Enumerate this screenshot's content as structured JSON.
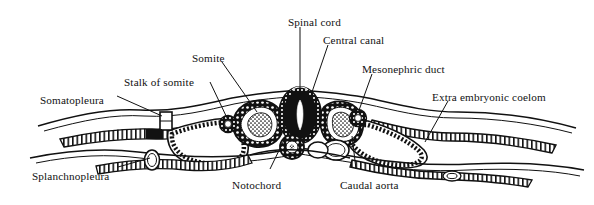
{
  "figure": {
    "background_color": "#ffffff",
    "ink_color": "#111111",
    "labels": [
      {
        "id": "spinal-cord",
        "text": "Spinal cord",
        "x": 288,
        "y": 16,
        "anchor": "start"
      },
      {
        "id": "central-canal",
        "text": "Central canal",
        "x": 323,
        "y": 34,
        "anchor": "start"
      },
      {
        "id": "somite",
        "text": "Somite",
        "x": 192,
        "y": 52,
        "anchor": "start"
      },
      {
        "id": "mesonephric-duct",
        "text": "Mesonephric duct",
        "x": 362,
        "y": 63,
        "anchor": "start"
      },
      {
        "id": "stalk-of-somite",
        "text": "Stalk of somite",
        "x": 124,
        "y": 76,
        "anchor": "start"
      },
      {
        "id": "extra-embryonic-coelom",
        "text": "Extra embryonic coelom",
        "x": 432,
        "y": 91,
        "anchor": "start"
      },
      {
        "id": "somatopleura",
        "text": "Somatopleura",
        "x": 40,
        "y": 94,
        "anchor": "start"
      },
      {
        "id": "splanchnopleura",
        "text": "Splanchnopleura",
        "x": 32,
        "y": 170,
        "anchor": "start"
      },
      {
        "id": "notochord",
        "text": "Notochord",
        "x": 232,
        "y": 179,
        "anchor": "start"
      },
      {
        "id": "caudal-aorta",
        "text": "Caudal aorta",
        "x": 340,
        "y": 179,
        "anchor": "start"
      }
    ],
    "leader_lines": [
      {
        "id": "leader-spinal-cord",
        "points": "300,27 300,95"
      },
      {
        "id": "leader-central-canal",
        "points": "328,45 312,92"
      },
      {
        "id": "leader-somite",
        "points": "222,62 257,112"
      },
      {
        "id": "leader-mesonephric-duct",
        "points": "372,74 358,113"
      },
      {
        "id": "leader-stalk-of-somite",
        "points": "210,82 228,120"
      },
      {
        "id": "leader-extra-embryonic-coelom",
        "points": "448,101 425,142"
      },
      {
        "id": "leader-somatopleura",
        "points": "117,96 162,116"
      },
      {
        "id": "leader-splanchnopleura",
        "points": "118,167 150,158"
      },
      {
        "id": "leader-notochord",
        "points": "270,169 286,136"
      },
      {
        "id": "leader-caudal-aorta",
        "points": "356,169 352,136"
      }
    ],
    "structures": [
      {
        "id": "neural-tube",
        "name": "spinal cord (neural tube)"
      },
      {
        "id": "central-canal-lumen",
        "name": "central canal"
      },
      {
        "id": "notochord-body",
        "name": "notochord"
      },
      {
        "id": "somite-left",
        "name": "left somite"
      },
      {
        "id": "somite-right",
        "name": "right somite"
      },
      {
        "id": "mesonephric-duct-left",
        "name": "left mesonephric duct"
      },
      {
        "id": "mesonephric-duct-right",
        "name": "right mesonephric duct"
      },
      {
        "id": "caudal-aorta-body",
        "name": "caudal aorta"
      },
      {
        "id": "coelom-left",
        "name": "left coelomic cavity"
      },
      {
        "id": "coelom-right",
        "name": "right coelomic cavity"
      },
      {
        "id": "somatopleura-membrane",
        "name": "somatopleura"
      },
      {
        "id": "splanchnopleura-membrane",
        "name": "splanchnopleura"
      }
    ]
  }
}
